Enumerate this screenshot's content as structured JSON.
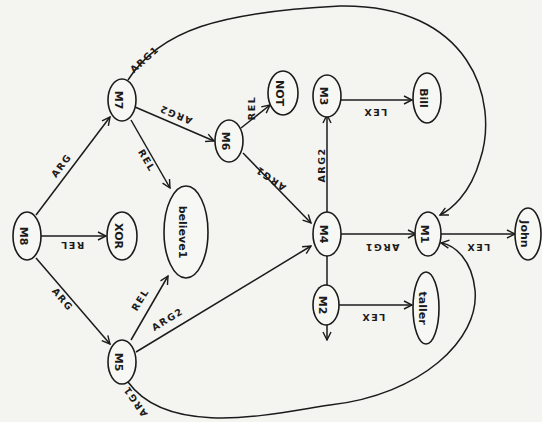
{
  "diagram": {
    "type": "semantic-network",
    "orientation": "rotated-90-clockwise",
    "colors": {
      "background": "#f4f4f1",
      "ink": "#1b1b1b"
    },
    "nodes": {
      "M8": "M8",
      "XOR": "XOR",
      "M7": "M7",
      "believe1": "believe1",
      "M5": "M5",
      "M6": "M6",
      "NOT": "NOT",
      "M3": "M3",
      "Bill": "Bill",
      "M4": "M4",
      "M1": "M1",
      "John": "John",
      "M2": "M2",
      "taller": "taller"
    },
    "edges": [
      {
        "from": "M8",
        "to": "M7",
        "label": "ARG"
      },
      {
        "from": "M8",
        "to": "XOR",
        "label": "REL"
      },
      {
        "from": "M8",
        "to": "M5",
        "label": "ARG"
      },
      {
        "from": "M7",
        "to": "believe1",
        "label": "REL"
      },
      {
        "from": "M7",
        "to": "M6",
        "label": "ARG2"
      },
      {
        "from": "M7",
        "to": "M1",
        "label": "ARG1"
      },
      {
        "from": "M5",
        "to": "believe1",
        "label": "REL"
      },
      {
        "from": "M5",
        "to": "M4",
        "label": "ARG2"
      },
      {
        "from": "M5",
        "to": "M1",
        "label": "ARG1"
      },
      {
        "from": "M6",
        "to": "NOT",
        "label": "REL"
      },
      {
        "from": "M6",
        "to": "M4",
        "label": "ARG1"
      },
      {
        "from": "M4",
        "to": "M3",
        "label": "ARG2"
      },
      {
        "from": "M4",
        "to": "M1",
        "label": "ARG1"
      },
      {
        "from": "M4",
        "to": "M2",
        "label": "REL"
      },
      {
        "from": "M3",
        "to": "Bill",
        "label": "LEX"
      },
      {
        "from": "M1",
        "to": "John",
        "label": "LEX"
      },
      {
        "from": "M2",
        "to": "taller",
        "label": "LEX"
      }
    ]
  }
}
